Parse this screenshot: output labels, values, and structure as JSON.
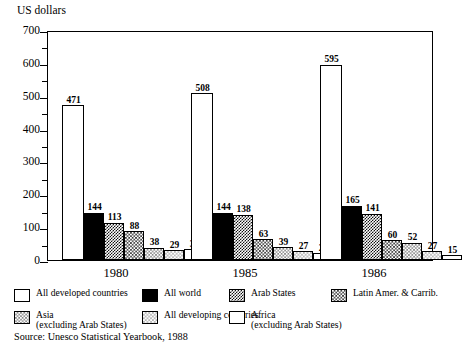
{
  "chart_data": {
    "type": "bar",
    "title": "",
    "ylabel": "US dollars",
    "xlabel": "",
    "ylim": [
      0,
      700
    ],
    "ytick_step": 100,
    "yminor_step": 50,
    "grid": false,
    "legend_position": "bottom",
    "categories": [
      "1980",
      "1985",
      "1986"
    ],
    "ytick_labels": [
      "700",
      "600",
      "500",
      "400",
      "300",
      "200",
      "100",
      "0"
    ],
    "ytick_values": [
      700,
      600,
      500,
      400,
      300,
      200,
      100,
      0
    ],
    "series": [
      {
        "name": "All developed countries",
        "fill": "white",
        "values": [
          471,
          508,
          595
        ]
      },
      {
        "name": "All world",
        "fill": "black",
        "values": [
          144,
          144,
          165
        ]
      },
      {
        "name": "Arab States",
        "fill": "dark-checker",
        "values": [
          113,
          138,
          141
        ]
      },
      {
        "name": "Latin Amer. & Carrib.",
        "fill": "medium-checker",
        "values": [
          88,
          63,
          60
        ]
      },
      {
        "name": "Asia (excluding Arab States)",
        "fill": "light-checker",
        "values": [
          38,
          39,
          52
        ]
      },
      {
        "name": "All developing countries",
        "fill": "very-light-checker",
        "values": [
          29,
          27,
          27
        ]
      },
      {
        "name": "Africa (excluding Arab States)",
        "fill": "white",
        "values": [
          33,
          20,
          15
        ]
      }
    ],
    "annotations": {
      "source": "Source: Unesco Statistical Yearbook, 1988"
    }
  },
  "legend": {
    "entries": [
      {
        "label": "All developed countries",
        "label2": ""
      },
      {
        "label": "All world",
        "label2": ""
      },
      {
        "label": "Arab States",
        "label2": ""
      },
      {
        "label": "Latin Amer. & Carrib.",
        "label2": ""
      },
      {
        "label": "Asia",
        "label2": "(excluding Arab States)"
      },
      {
        "label": "All developing countries",
        "label2": ""
      },
      {
        "label": "Africa",
        "label2": "(excluding Arab States)"
      }
    ]
  },
  "source_note": "Source: Unesco Statistical Yearbook, 1988"
}
